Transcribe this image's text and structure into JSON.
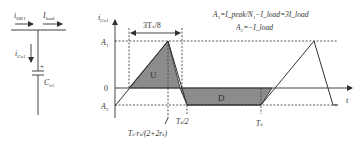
{
  "circuit": {
    "current_in": {
      "base": "i",
      "sub": "DR1"
    },
    "current_load": {
      "base": "I",
      "sub": "load"
    },
    "current_cap": {
      "base": "i",
      "sub": "Co1"
    },
    "capacitor": {
      "base": "C",
      "sub": "o1"
    },
    "polarity": "+"
  },
  "plot": {
    "y_axis_label": {
      "base": "i",
      "sub": "Co1"
    },
    "x_axis_label": "t",
    "y_ticks": [
      {
        "label": "A",
        "sub": "1"
      },
      {
        "label": "0",
        "sub": ""
      },
      {
        "label": "A",
        "sub": "2"
      }
    ],
    "region_labels": {
      "up": "U",
      "down": "D"
    },
    "dimension_label": "3Tₛ/8",
    "x_markers": {
      "peak_time": "Tₛ·rₛ/(2+2rₛ)",
      "half_period": "Tₛ/2",
      "period": "Tₛ"
    },
    "equations": {
      "line1": "A₁=I_peak/N₁−I_load=3I_load",
      "line2": "A₂=−I_load"
    }
  },
  "colors": {
    "line": "#333333",
    "fill": "#8c8c8c",
    "background": "#ffffff"
  }
}
